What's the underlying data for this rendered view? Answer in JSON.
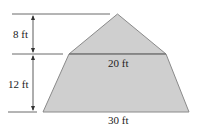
{
  "diagram": {
    "type": "composite-shape-dimensions",
    "colors": {
      "fill": "#cfcfcf",
      "outline": "#8a8a8a",
      "dimension_lines": "#333333",
      "text": "#222222"
    },
    "labels": {
      "triangle_height": "8 ft",
      "trapezoid_height": "12 ft",
      "top_width": "20 ft",
      "bottom_width": "30 ft"
    },
    "dimensions": {
      "triangle_height_ft": 8,
      "trapezoid_height_ft": 12,
      "trapezoid_top_width_ft": 20,
      "trapezoid_bottom_width_ft": 30
    }
  }
}
